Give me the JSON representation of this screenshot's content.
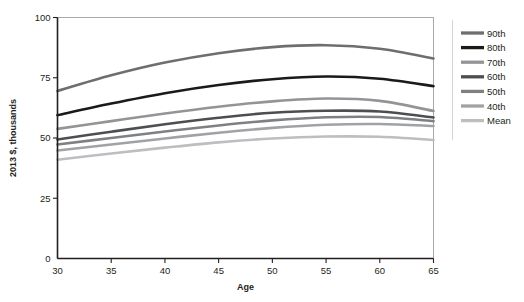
{
  "chart_data": {
    "type": "line",
    "title": "",
    "subtitle": "",
    "xlabel": "Age",
    "ylabel": "2013 $, thousands",
    "xlim": [
      30,
      65
    ],
    "ylim": [
      0,
      100
    ],
    "xticks": [
      30,
      35,
      40,
      45,
      50,
      55,
      60,
      65
    ],
    "xticklabels": [
      "30",
      "35",
      "40",
      "45",
      "50",
      "55",
      "60",
      "65"
    ],
    "yticks": [
      0,
      25,
      50,
      75,
      100
    ],
    "yticklabels": [
      "0",
      "25",
      "50",
      "75",
      "100"
    ],
    "grid": false,
    "legend_position": "right",
    "x": [
      30,
      35,
      40,
      45,
      50,
      55,
      60,
      65
    ],
    "series": [
      {
        "name": "90th",
        "color": "#6d6e71",
        "width": 2.6,
        "values": [
          69.5,
          76.0,
          81.3,
          85.2,
          87.7,
          88.5,
          87.0,
          83.0
        ]
      },
      {
        "name": "80th",
        "color": "#1a1a1a",
        "width": 2.6,
        "values": [
          59.5,
          64.3,
          68.6,
          72.0,
          74.4,
          75.5,
          74.6,
          71.5
        ]
      },
      {
        "name": "70th",
        "color": "#929497",
        "width": 2.6,
        "values": [
          53.8,
          57.0,
          60.2,
          63.0,
          65.2,
          66.4,
          65.4,
          61.2
        ]
      },
      {
        "name": "60th",
        "color": "#4d4e50",
        "width": 2.6,
        "values": [
          49.4,
          52.6,
          55.7,
          58.4,
          60.5,
          61.3,
          61.0,
          58.5
        ]
      },
      {
        "name": "50th",
        "color": "#7f8083",
        "width": 2.6,
        "values": [
          47.3,
          50.0,
          52.7,
          55.2,
          57.3,
          58.6,
          58.7,
          57.0
        ]
      },
      {
        "name": "40th",
        "color": "#a0a2a5",
        "width": 2.6,
        "values": [
          44.8,
          47.3,
          49.8,
          52.2,
          54.2,
          55.5,
          55.8,
          55.0
        ]
      },
      {
        "name": "Mean",
        "color": "#bcbec0",
        "width": 2.6,
        "values": [
          41.0,
          43.6,
          46.0,
          48.2,
          49.8,
          50.6,
          50.5,
          49.2
        ]
      }
    ]
  },
  "legend": {
    "items": [
      {
        "label": "90th"
      },
      {
        "label": "80th"
      },
      {
        "label": "70th"
      },
      {
        "label": "60th"
      },
      {
        "label": "50th"
      },
      {
        "label": "40th"
      },
      {
        "label": "Mean"
      }
    ]
  },
  "axes": {
    "x_title": "Age",
    "y_title": "2013 $, thousands"
  }
}
